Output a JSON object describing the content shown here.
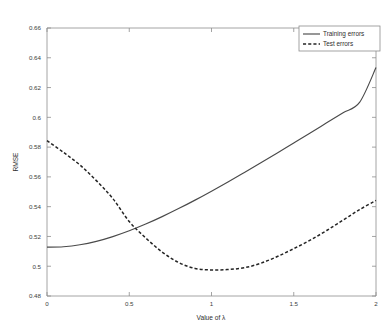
{
  "chart_data": {
    "type": "line",
    "title": "",
    "subtitle": "",
    "xlabel": "Value of λ",
    "ylabel": "RMSE",
    "xlim": [
      0,
      2
    ],
    "ylim": [
      0.48,
      0.66
    ],
    "xticks": [
      0,
      0.5,
      1,
      1.5,
      2
    ],
    "xtick_labels": [
      "0",
      "0.5",
      "1",
      "1.5",
      "2"
    ],
    "yticks": [
      0.48,
      0.5,
      0.52,
      0.54,
      0.56,
      0.58,
      0.6,
      0.62,
      0.64,
      0.66
    ],
    "ytick_labels": [
      "0.48",
      "0.5",
      "0.52",
      "0.54",
      "0.56",
      "0.58",
      "0.6",
      "0.62",
      "0.64",
      "0.66"
    ],
    "grid": false,
    "legend_position": "top-right",
    "legend_entries": [
      {
        "label": "Training errors",
        "style": "solid",
        "color": "#4a4a4a"
      },
      {
        "label": "Test errors",
        "style": "dashed",
        "color": "#242424"
      }
    ],
    "x": [
      0,
      0.1,
      0.2,
      0.3,
      0.4,
      0.5,
      0.6,
      0.7,
      0.8,
      0.9,
      1.0,
      1.1,
      1.2,
      1.3,
      1.4,
      1.5,
      1.6,
      1.7,
      1.8,
      1.9,
      2.0
    ],
    "series": [
      {
        "name": "Training errors",
        "style": "solid",
        "color": "#4a4a4a",
        "values": [
          0.5128,
          0.5131,
          0.5144,
          0.5167,
          0.5199,
          0.5238,
          0.5283,
          0.5333,
          0.5387,
          0.5444,
          0.5504,
          0.5566,
          0.563,
          0.5695,
          0.5761,
          0.5828,
          0.5895,
          0.5963,
          0.6031,
          0.61,
          0.6334
        ]
      },
      {
        "name": "Test errors",
        "style": "dashed",
        "color": "#242424",
        "values": [
          0.5843,
          0.5765,
          0.568,
          0.5575,
          0.5455,
          0.53,
          0.519,
          0.5095,
          0.5025,
          0.4985,
          0.4975,
          0.4978,
          0.499,
          0.502,
          0.5065,
          0.5118,
          0.5175,
          0.524,
          0.531,
          0.538,
          0.5442
        ]
      }
    ],
    "annotations": [
      {
        "text": "curves cross near λ ≈ 0.49 at RMSE ≈ 0.529"
      },
      {
        "text": "test error minimum near λ ≈ 1.0 at RMSE ≈ 0.4975"
      }
    ]
  },
  "figure": {
    "background_color": "#ffffff",
    "axis_color": "#8d8d8d"
  }
}
